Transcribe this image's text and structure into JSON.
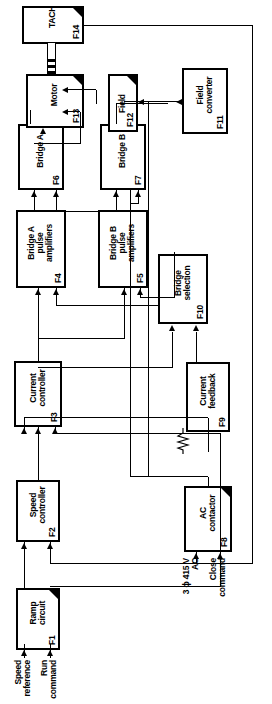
{
  "figure": {
    "type": "block-diagram",
    "orientation": "rotated-90-ccw"
  },
  "blocks": [
    {
      "id": "F1",
      "tag": "F1",
      "name": "Ramp\ncircuit"
    },
    {
      "id": "F2",
      "tag": "F2",
      "name": "Speed\ncontroller"
    },
    {
      "id": "F3",
      "tag": "F3",
      "name": "Current\ncontroller"
    },
    {
      "id": "F4",
      "tag": "F4",
      "name": "Bridge A\npulse\namplifiers"
    },
    {
      "id": "F5",
      "tag": "F5",
      "name": "Bridge B\npulse\namplifiers"
    },
    {
      "id": "F6",
      "tag": "F6",
      "name": "Bridge A"
    },
    {
      "id": "F7",
      "tag": "F7",
      "name": "Bridge B"
    },
    {
      "id": "F8",
      "tag": "F8",
      "name": "AC\ncontactor"
    },
    {
      "id": "F9",
      "tag": "F9",
      "name": "Current\nfeedback"
    },
    {
      "id": "F10",
      "tag": "F10",
      "name": "Bridge\nselection"
    },
    {
      "id": "F11",
      "tag": "F11",
      "name": "Field\nconverter"
    },
    {
      "id": "F12",
      "tag": "F12",
      "name": "Field"
    },
    {
      "id": "F13",
      "tag": "F13",
      "name": "Motor"
    },
    {
      "id": "F14",
      "tag": "F14",
      "name": "TACHO"
    }
  ],
  "external_labels": [
    {
      "id": "speed-reference",
      "text": "Speed\nreference"
    },
    {
      "id": "run-command",
      "text": "Run\ncommand"
    },
    {
      "id": "supply",
      "text": "3 ϕ 415 V\nAC"
    },
    {
      "id": "close-command",
      "text": "Close\ncommand"
    }
  ],
  "colors": {
    "line": "#000000",
    "background": "#ffffff"
  }
}
